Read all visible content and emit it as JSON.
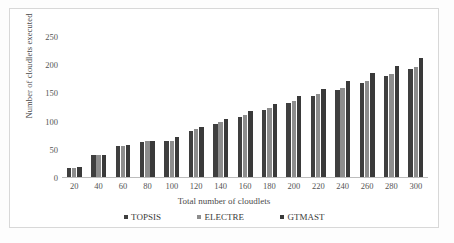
{
  "chart_data": {
    "type": "bar",
    "title": "",
    "xlabel": "Total number of cloudlets",
    "ylabel": "Number of cloudlets executed",
    "categories": [
      20,
      40,
      60,
      80,
      100,
      120,
      140,
      160,
      180,
      200,
      220,
      240,
      260,
      280,
      300
    ],
    "yticks": [
      250,
      200,
      150,
      100,
      50,
      0
    ],
    "ylim": [
      0,
      250
    ],
    "grid": false,
    "legend_position": "bottom",
    "series": [
      {
        "name": "TOPSIS",
        "color": "#3f3f3f",
        "values": [
          18,
          40,
          56,
          63,
          65,
          84,
          96,
          109,
          120,
          133,
          145,
          156,
          168,
          181,
          193
        ]
      },
      {
        "name": "ELECTRE",
        "color": "#8d8d8d",
        "values": [
          18,
          40,
          57,
          65,
          65,
          87,
          99,
          111,
          124,
          137,
          149,
          160,
          172,
          185,
          197
        ]
      },
      {
        "name": "GTMAST",
        "color": "#3a3a3a",
        "values": [
          19,
          40,
          58,
          66,
          72,
          91,
          105,
          118,
          132,
          145,
          158,
          172,
          186,
          199,
          212
        ]
      }
    ]
  }
}
